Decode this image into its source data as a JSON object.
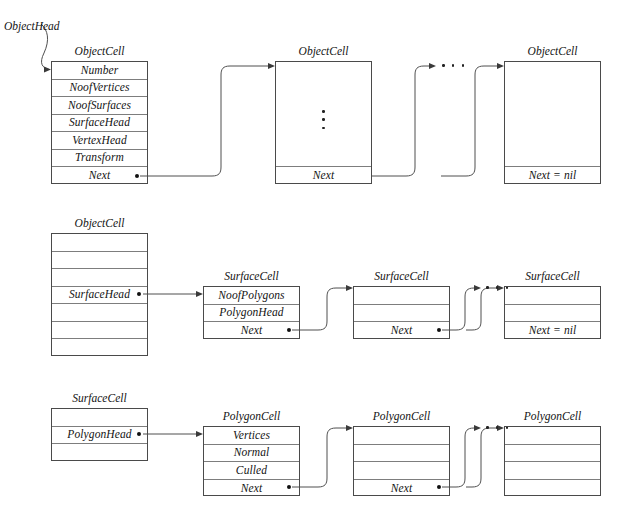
{
  "figure": {
    "title_artifact": "",
    "pointer_label": "ObjectHead"
  },
  "rows": [
    {
      "id": "object-list",
      "cells": [
        {
          "name": "object-cell-first",
          "caption": "ObjectCell",
          "fields": [
            "Number",
            "NoofVertices",
            "NoofSurfaces",
            "SurfaceHead",
            "VertexHead",
            "Transform",
            "Next"
          ]
        },
        {
          "name": "object-cell-middle",
          "caption": "ObjectCell",
          "fields": [
            "",
            "Next"
          ],
          "has_vertical_ellipsis": true
        },
        {
          "name": "object-cell-last",
          "caption": "ObjectCell",
          "fields": [
            "",
            "Next = nil"
          ]
        }
      ]
    },
    {
      "id": "surface-list",
      "cells": [
        {
          "name": "object-cell-surfacehead",
          "caption": "ObjectCell",
          "fields": [
            "",
            "",
            "",
            "SurfaceHead",
            "",
            "",
            ""
          ]
        },
        {
          "name": "surface-cell-first",
          "caption": "SurfaceCell",
          "fields": [
            "NoofPolygons",
            "PolygonHead",
            "Next"
          ]
        },
        {
          "name": "surface-cell-middle",
          "caption": "SurfaceCell",
          "fields": [
            "",
            "",
            "Next"
          ]
        },
        {
          "name": "surface-cell-last",
          "caption": "SurfaceCell",
          "fields": [
            "",
            "",
            "Next = nil"
          ]
        }
      ]
    },
    {
      "id": "polygon-list",
      "cells": [
        {
          "name": "surface-cell-polygonhead",
          "caption": "SurfaceCell",
          "fields": [
            "",
            "PolygonHead",
            ""
          ]
        },
        {
          "name": "polygon-cell-first",
          "caption": "PolygonCell",
          "fields": [
            "Vertices",
            "Normal",
            "Culled",
            "Next"
          ]
        },
        {
          "name": "polygon-cell-middle",
          "caption": "PolygonCell",
          "fields": [
            "",
            "",
            "",
            "Next"
          ]
        },
        {
          "name": "polygon-cell-last",
          "caption": "PolygonCell",
          "fields": [
            "",
            "",
            "",
            ""
          ]
        }
      ]
    }
  ],
  "captions": {
    "object_cell": "ObjectCell",
    "surface_cell": "SurfaceCell",
    "polygon_cell": "PolygonCell"
  },
  "field_labels": {
    "number": "Number",
    "noof_vertices": "NoofVertices",
    "noof_surfaces": "NoofSurfaces",
    "surface_head": "SurfaceHead",
    "vertex_head": "VertexHead",
    "transform": "Transform",
    "next": "Next",
    "next_nil": "Next = nil",
    "noof_polygons": "NoofPolygons",
    "polygon_head": "PolygonHead",
    "vertices": "Vertices",
    "normal": "Normal",
    "culled": "Culled"
  },
  "colors": {
    "stroke": "#4a4a4a",
    "inner_rule": "#7d7d7d",
    "text": "#131313",
    "background": "#ffffff"
  }
}
